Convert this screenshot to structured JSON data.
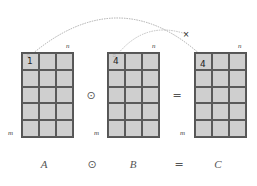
{
  "diagram": {
    "matrices": [
      {
        "id": "A",
        "label": "A",
        "rows": 5,
        "cols": 3,
        "dim_cols": "n",
        "dim_rows": "m",
        "highlight_value": "1",
        "highlight_mark": "□"
      },
      {
        "id": "B",
        "label": "B",
        "rows": 5,
        "cols": 3,
        "dim_cols": "n",
        "dim_rows": "m",
        "highlight_value": "4",
        "highlight_mark": "□"
      },
      {
        "id": "C",
        "label": "C",
        "rows": 5,
        "cols": 3,
        "dim_cols": "n",
        "dim_rows": "m",
        "highlight_value": "4",
        "highlight_mark": ""
      }
    ],
    "operators": {
      "hadamard": "⊙",
      "equals": "="
    },
    "equation": {
      "left": "A",
      "op": "⊙",
      "right": "B",
      "eq": "=",
      "result": "C"
    },
    "arrow_marker": "×",
    "colors": {
      "cell_fill": "#cfcfcf",
      "grid_line": "#5a5a5a",
      "arc": "#9a9a9a"
    }
  }
}
